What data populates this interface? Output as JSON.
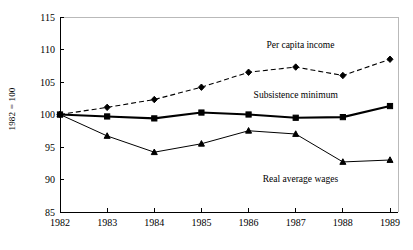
{
  "chart_data": {
    "type": "line",
    "title": "",
    "xlabel": "",
    "ylabel": "1982 = 100",
    "x": [
      1982,
      1983,
      1984,
      1985,
      1986,
      1987,
      1988,
      1989
    ],
    "xtick_labels": [
      "1982",
      "1983",
      "1984",
      "1985",
      "1986",
      "1987",
      "1988",
      "1989"
    ],
    "ytick_labels": [
      "85",
      "90",
      "95",
      "100",
      "105",
      "110",
      "115"
    ],
    "yticks": [
      85,
      90,
      95,
      100,
      105,
      110,
      115
    ],
    "ylim": [
      85,
      115
    ],
    "xlim": [
      1982,
      1989
    ],
    "grid": false,
    "legend_position": "inline-annotations",
    "series": [
      {
        "name": "Per capita income",
        "label": "Per capita income",
        "style": "dashed",
        "marker": "diamond",
        "color": "#000000",
        "values": [
          100.0,
          101.1,
          102.3,
          104.2,
          106.5,
          107.3,
          106.0,
          108.5
        ]
      },
      {
        "name": "Subsistence minimum",
        "label": "Subsistence minimum",
        "style": "solid-thick",
        "marker": "square",
        "color": "#000000",
        "values": [
          100.0,
          99.7,
          99.4,
          100.3,
          100.0,
          99.5,
          99.6,
          101.3
        ]
      },
      {
        "name": "Real average wages",
        "label": "Real average wages",
        "style": "solid-thin",
        "marker": "triangle",
        "color": "#000000",
        "values": [
          100.0,
          96.7,
          94.2,
          95.5,
          97.5,
          97.0,
          92.7,
          93.0
        ]
      }
    ],
    "annotations": [
      {
        "text": "Per capita income",
        "x": 1987.1,
        "y": 110.2
      },
      {
        "text": "Subsistence minimum",
        "x": 1987.0,
        "y": 102.6
      },
      {
        "text": "Real average wages",
        "x": 1987.1,
        "y": 89.6
      }
    ]
  }
}
